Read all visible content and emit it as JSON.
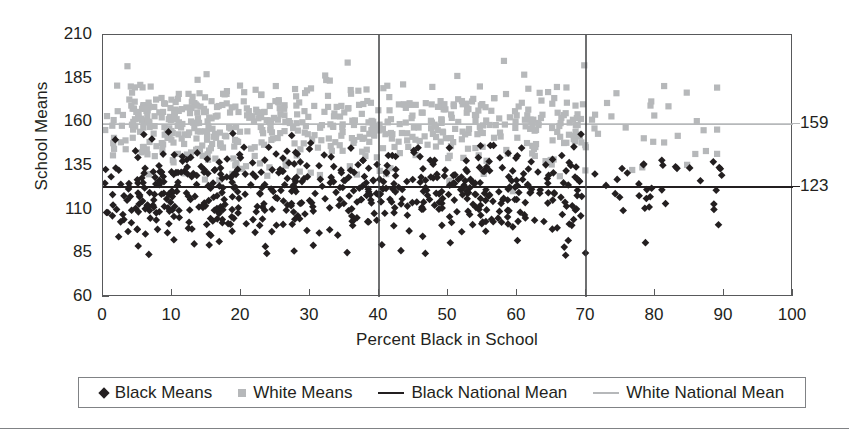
{
  "chart_data": {
    "type": "scatter",
    "title": "",
    "xlabel": "Percent Black in School",
    "ylabel": "School Means",
    "xlim": [
      0,
      100
    ],
    "ylim": [
      60,
      210
    ],
    "xticks": [
      0,
      10,
      20,
      30,
      40,
      50,
      60,
      70,
      80,
      90,
      100
    ],
    "yticks": [
      60,
      85,
      110,
      135,
      160,
      185,
      210
    ],
    "grid": false,
    "legend_position": "bottom",
    "series": [
      {
        "name": "Black Means",
        "marker": "diamond",
        "color": "#231f20",
        "description": "School mean achievement scores for Black students, plotted against percent Black enrollment; cloud centered near 120 with spread roughly 85-150."
      },
      {
        "name": "White Means",
        "marker": "square",
        "color": "#b6b8ba",
        "description": "School mean achievement scores for White students, plotted against percent Black enrollment; cloud centered near 158 with spread roughly 130-195."
      }
    ],
    "reference_lines": [
      {
        "name": "Black National Mean",
        "orientation": "horizontal",
        "value": 123,
        "label": "123",
        "color": "#231f20"
      },
      {
        "name": "White National Mean",
        "orientation": "horizontal",
        "value": 159,
        "label": "159",
        "color": "#b6b8ba"
      },
      {
        "name": "vertical-marker-40",
        "orientation": "vertical",
        "value": 40,
        "label": "",
        "color": "#3f4042"
      },
      {
        "name": "vertical-marker-70",
        "orientation": "vertical",
        "value": 70,
        "label": "",
        "color": "#3f4042"
      }
    ],
    "series_points": {
      "black_means": {
        "x_range": [
          0,
          90
        ],
        "y_center": 120,
        "y_sd": 14,
        "n": 620
      },
      "white_means": {
        "x_range": [
          0,
          89
        ],
        "y_center": 158,
        "y_sd": 12,
        "n": 620
      }
    }
  },
  "axes": {
    "y_title": "School Means",
    "x_title": "Percent Black in School",
    "y_tick_labels": [
      "210",
      "185",
      "160",
      "135",
      "110",
      "85",
      "60"
    ],
    "x_tick_labels": [
      "0",
      "10",
      "20",
      "30",
      "40",
      "50",
      "60",
      "70",
      "80",
      "90",
      "100"
    ]
  },
  "right_labels": [
    {
      "name": "white-national-mean-value",
      "text": "159",
      "value": 159
    },
    {
      "name": "black-national-mean-value",
      "text": "123",
      "value": 123
    }
  ],
  "legend": {
    "items": [
      {
        "label": "Black Means",
        "marker": "diamond",
        "color": "#231f20"
      },
      {
        "label": "White Means",
        "marker": "square",
        "color": "#b6b8ba"
      },
      {
        "label": "Black National Mean",
        "marker": "line",
        "color": "#231f20"
      },
      {
        "label": "White National Mean",
        "marker": "line",
        "color": "#b6b8ba"
      }
    ]
  },
  "colors": {
    "black_series": "#231f20",
    "white_series": "#b6b8ba",
    "axis": "#58595b",
    "reference_vertical": "#3f4042",
    "rule": "#808285"
  }
}
